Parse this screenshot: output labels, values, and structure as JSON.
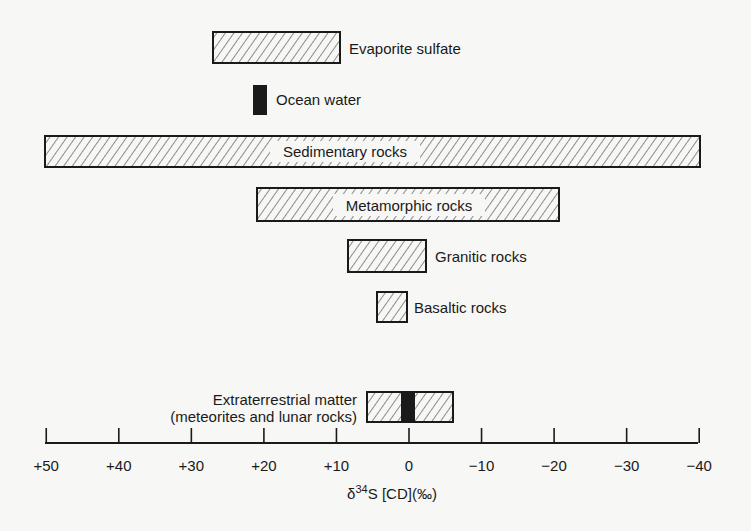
{
  "chart_data": {
    "type": "range-bar",
    "title": "",
    "xlabel": "δ34S [CD](‰)",
    "xlabel_parts": {
      "delta": "δ",
      "sup": "34",
      "rest": "S [CD](‰)"
    },
    "ylabel": "",
    "xlim": [
      50,
      -40
    ],
    "x_reversed": true,
    "x_ticks": [
      50,
      40,
      30,
      20,
      10,
      0,
      -10,
      -20,
      -30,
      -40
    ],
    "x_tick_labels": [
      "+50",
      "+40",
      "+30",
      "+20",
      "+10",
      "0",
      "−10",
      "−20",
      "−30",
      "−40"
    ],
    "grid": false,
    "series": [
      {
        "name": "Evaporite sulfate",
        "min": 9.5,
        "max": 27,
        "fill": "hatched",
        "label_position": "right"
      },
      {
        "name": "Ocean water",
        "min": 19.5,
        "max": 21.5,
        "fill": "solid",
        "label_position": "right"
      },
      {
        "name": "Sedimentary rocks",
        "min": -40,
        "max": 50,
        "fill": "hatched",
        "label_position": "inside"
      },
      {
        "name": "Metamorphic rocks",
        "min": -20,
        "max": 21,
        "fill": "hatched",
        "label_position": "inside"
      },
      {
        "name": "Granitic rocks",
        "min": -2.5,
        "max": 8.5,
        "fill": "hatched",
        "label_position": "right"
      },
      {
        "name": "Basaltic rocks",
        "min": 0.3,
        "max": 4.4,
        "fill": "hatched",
        "label_position": "right"
      },
      {
        "name": "Extraterrestrial matter (meteorites and lunar rocks)",
        "min": -6,
        "max": 6,
        "fill": "hatched",
        "core_min": -0.8,
        "core_max": 1,
        "core_fill": "solid",
        "label_position": "left"
      }
    ]
  },
  "labels": {
    "evaporite": "Evaporite sulfate",
    "ocean": "Ocean water",
    "sedimentary": "Sedimentary rocks",
    "metamorphic": "Metamorphic rocks",
    "granitic": "Granitic rocks",
    "basaltic": "Basaltic rocks",
    "extraterrestrial_line1": "Extraterrestrial matter",
    "extraterrestrial_line2": "(meteorites and lunar rocks)"
  },
  "colors": {
    "ink": "#1a1a1a",
    "background": "#f7f7f5"
  }
}
